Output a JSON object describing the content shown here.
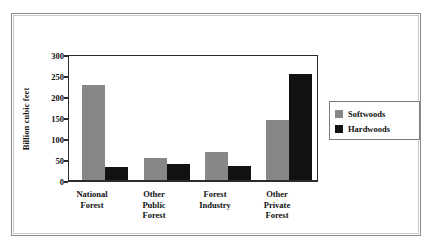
{
  "chart_data": {
    "type": "bar",
    "title": "",
    "subtitle": "",
    "xlabel": "",
    "ylabel": "Billion cubic feet",
    "ylim": [
      0,
      300
    ],
    "yticks": [
      "0",
      "50",
      "100",
      "150",
      "200",
      "250",
      "300"
    ],
    "grid": false,
    "legend_position": "right",
    "categories": [
      "National\nForest",
      "Other\nPublic\nForest",
      "Forest\nIndustry",
      "Other\nPrivate\nForest"
    ],
    "series": [
      {
        "name": "Softwoods",
        "color": "#878787",
        "values": [
          225,
          52,
          67,
          141
        ]
      },
      {
        "name": "Hardwoods",
        "color": "#121212",
        "values": [
          30,
          38,
          32,
          250
        ]
      }
    ]
  },
  "legend": {
    "items": [
      {
        "label": "Softwoods",
        "color": "#878787"
      },
      {
        "label": "Hardwoods",
        "color": "#121212"
      }
    ]
  },
  "axis": {
    "y_title": "Billion cubic feet",
    "tick_0": "0",
    "tick_1": "50",
    "tick_2": "100",
    "tick_3": "150",
    "tick_4": "200",
    "tick_5": "250",
    "tick_6": "300"
  },
  "xlabels": {
    "g0": "National\nForest",
    "g1": "Other\nPublic\nForest",
    "g2": "Forest\nIndustry",
    "g3": "Other\nPrivate\nForest"
  }
}
